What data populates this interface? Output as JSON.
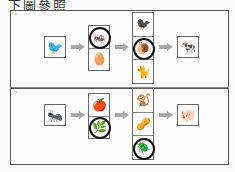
{
  "header": {
    "text": "下圖參照"
  },
  "panels": [
    {
      "label": "①",
      "producer": {
        "icon": "sparrow",
        "glyph": "🐦"
      },
      "level2": [
        {
          "icon": "grasshopper",
          "glyph": "🦗",
          "circled": true
        },
        {
          "icon": "egg",
          "glyph": "🥚",
          "circled": false
        }
      ],
      "level3": [
        {
          "icon": "crow",
          "glyph": "🐦‍⬛",
          "circled": false
        },
        {
          "icon": "snail",
          "glyph": "🐌",
          "circled": true
        },
        {
          "icon": "cat",
          "glyph": "🐈",
          "circled": false
        }
      ],
      "consumer": {
        "icon": "cow",
        "glyph": "🐄"
      }
    },
    {
      "label": "②",
      "producer": {
        "icon": "ant",
        "glyph": "🐜"
      },
      "level2": [
        {
          "icon": "apple",
          "glyph": "🍎",
          "circled": false
        },
        {
          "icon": "plant-sprout",
          "glyph": "🌿",
          "circled": true
        }
      ],
      "level3": [
        {
          "icon": "monkey",
          "glyph": "🐒",
          "circled": false
        },
        {
          "icon": "nuts",
          "glyph": "🥜",
          "circled": false
        },
        {
          "icon": "beetle",
          "glyph": "🪲",
          "circled": true
        }
      ],
      "consumer": {
        "icon": "pig",
        "glyph": "🐖"
      }
    }
  ],
  "colors": {
    "arrow": "#a8a8a8",
    "border": "#555555",
    "circle": "#111111"
  }
}
